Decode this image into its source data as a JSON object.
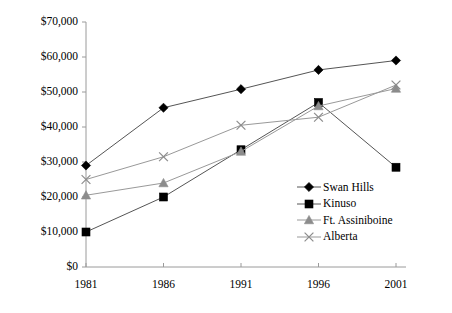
{
  "chart_data": {
    "type": "line",
    "title": "",
    "subtitle": "",
    "xlabel": "",
    "ylabel": "",
    "categories": [
      "1981",
      "1986",
      "1991",
      "1996",
      "2001"
    ],
    "x": [
      1981,
      1986,
      1991,
      1996,
      2001
    ],
    "xlim": [
      1981,
      2001
    ],
    "ylim": [
      0,
      70000
    ],
    "grid": false,
    "legend_position": "inside-bottom-right",
    "y_tick_labels": [
      "$70,000",
      "$60,000",
      "$50,000",
      "$40,000",
      "$30,000",
      "$20,000",
      "$10,000",
      "$0"
    ],
    "y_tick_values": [
      70000,
      60000,
      50000,
      40000,
      30000,
      20000,
      10000,
      0
    ],
    "x_tick_labels": [
      "1981",
      "1986",
      "1991",
      "1996",
      "2001"
    ],
    "series": [
      {
        "name": "Swan Hills",
        "marker": "diamond",
        "color": "#000000",
        "line_color": "#555555",
        "values": [
          29000,
          45500,
          50800,
          56300,
          59000
        ]
      },
      {
        "name": "Kinuso",
        "marker": "square",
        "color": "#000000",
        "line_color": "#555555",
        "values": [
          10000,
          20000,
          33500,
          47000,
          28500
        ]
      },
      {
        "name": "Ft. Assiniboine",
        "marker": "triangle",
        "color": "#8c8c8c",
        "line_color": "#999999",
        "values": [
          20500,
          24000,
          33000,
          46000,
          51000
        ]
      },
      {
        "name": "Alberta",
        "marker": "x",
        "color": "#8c8c8c",
        "line_color": "#999999",
        "values": [
          25000,
          31500,
          40500,
          42800,
          52000
        ]
      }
    ]
  },
  "legend": {
    "entries": [
      {
        "label": "Swan Hills"
      },
      {
        "label": "Kinuso"
      },
      {
        "label": "Ft. Assiniboine"
      },
      {
        "label": "Alberta"
      }
    ]
  },
  "axes": {
    "axis_color": "#9a9a9a"
  }
}
